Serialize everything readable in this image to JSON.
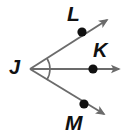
{
  "figure": {
    "type": "geometry-angle-diagram",
    "width": 131,
    "height": 138,
    "background_color": "#ffffff",
    "line_color": "#6b6b6b",
    "arc_color": "#6b6b6b",
    "point_color": "#111111",
    "label_color": "#111111",
    "vertex": {
      "name": "J",
      "label": "J",
      "x": 30,
      "y": 69
    },
    "rays": [
      {
        "name": "ray-JL",
        "through_point": "L",
        "start_x": 30,
        "start_y": 69,
        "end_x": 110,
        "end_y": 18,
        "arrowhead": true
      },
      {
        "name": "ray-JK",
        "through_point": "K",
        "start_x": 30,
        "start_y": 69,
        "end_x": 122,
        "end_y": 69,
        "arrowhead": true
      },
      {
        "name": "ray-JM",
        "through_point": "M",
        "start_x": 30,
        "start_y": 69,
        "end_x": 107,
        "end_y": 116,
        "arrowhead": true
      }
    ],
    "points": [
      {
        "name": "L",
        "label": "L",
        "x": 82,
        "y": 32,
        "radius": 4.6,
        "label_x": 67,
        "label_y": 3
      },
      {
        "name": "K",
        "label": "K",
        "x": 93,
        "y": 69,
        "radius": 4.6,
        "label_x": 93,
        "label_y": 40
      },
      {
        "name": "M",
        "label": "M",
        "x": 84,
        "y": 104,
        "radius": 4.6,
        "label_x": 65,
        "label_y": 112
      }
    ],
    "arc": {
      "name": "angle-arc-LJM",
      "center_x": 30,
      "center_y": 69,
      "radius": 20,
      "from_point": "L",
      "to_point": "M",
      "spans": "angle LJM"
    }
  }
}
